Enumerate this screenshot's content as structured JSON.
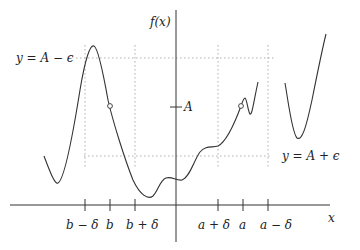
{
  "diagram": {
    "axes": {
      "y_label": "f(x)",
      "x_label": "x"
    },
    "y_ticks": {
      "A": "A"
    },
    "guide_labels": {
      "upper": "y = A − ϵ",
      "lower": "y = A + ϵ"
    },
    "x_ticks": {
      "b_minus_delta": "b − δ",
      "b": "b",
      "b_plus_delta": "b + δ",
      "a_plus_delta": "a + δ",
      "a": "a",
      "a_minus_delta": "a − δ"
    },
    "open_points": [
      {
        "name": "hole-at-b",
        "x": "b"
      },
      {
        "name": "hole-at-a",
        "x": "a"
      }
    ]
  }
}
